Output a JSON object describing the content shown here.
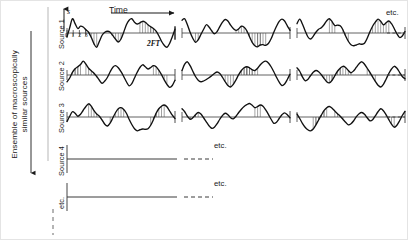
{
  "figure": {
    "title_axis_time": "Time",
    "amplitude_symbol": "s",
    "ensemble_label": "Ensemble of macroscopically\nsimilar sources",
    "tick_numbers": "0 1 2 3",
    "interval_label": "2FT",
    "etc_right_top": "etc.",
    "etc_row_source4": "etc.",
    "etc_row_etc": "etc.",
    "row_labels": [
      "Source 1",
      "Source 2",
      "Source 3",
      "Source 4",
      "etc."
    ],
    "colors": {
      "ink": "#1a1a1a",
      "trace": "#111111",
      "baseline": "#3a3a3a",
      "hatch": "#555555",
      "frame": "#e4e4e4",
      "background": "#ffffff"
    }
  },
  "chart_data": {
    "type": "line",
    "xlabel": "Time",
    "ylabel": "s",
    "grid": false,
    "legend": null,
    "x_tick_labels": [
      "0",
      "1",
      "2",
      "3"
    ],
    "annotations": [
      "2FT",
      "etc."
    ],
    "panel_columns": 3,
    "panel_rows": 3,
    "note": "Rows 4 and 5 (Source 4, etc.) are drawn as blank baselines continued by dashed lines ending in 'etc.'",
    "series": [
      {
        "name": "Source 1 / segment 1",
        "x": [
          0,
          1,
          2,
          3,
          4,
          5,
          6,
          7,
          8,
          9,
          10,
          11,
          12,
          13,
          14,
          15,
          16,
          17,
          18,
          19,
          20,
          21,
          22,
          23,
          24,
          25,
          26,
          27,
          28,
          29,
          30,
          31,
          32,
          33,
          34,
          35,
          36,
          37,
          38,
          39,
          40
        ],
        "values": [
          -0.25,
          0.35,
          0.95,
          0.62,
          0.3,
          0.46,
          0.4,
          0.22,
          0.05,
          -0.3,
          -0.72,
          -0.95,
          -0.55,
          -0.15,
          0.05,
          0.12,
          0.05,
          -0.18,
          -0.42,
          -0.6,
          -0.4,
          0.05,
          0.55,
          0.85,
          0.95,
          0.72,
          0.6,
          0.68,
          0.78,
          0.72,
          0.55,
          0.42,
          0.3,
          0.12,
          -0.18,
          -0.55,
          -0.82,
          -0.95,
          -0.7,
          -0.25,
          0.25
        ]
      },
      {
        "name": "Source 1 / segment 2",
        "x": [
          0,
          1,
          2,
          3,
          4,
          5,
          6,
          7,
          8,
          9,
          10,
          11,
          12,
          13,
          14,
          15,
          16,
          17,
          18,
          19,
          20,
          21,
          22,
          23,
          24,
          25,
          26,
          27,
          28,
          29,
          30,
          31,
          32,
          33,
          34,
          35,
          36,
          37,
          38,
          39,
          40
        ],
        "values": [
          0.85,
          0.95,
          0.55,
          0.05,
          -0.35,
          -0.62,
          -0.45,
          -0.1,
          0.25,
          0.55,
          0.4,
          0.15,
          -0.05,
          0.1,
          0.42,
          0.72,
          0.9,
          0.8,
          0.52,
          0.3,
          0.18,
          0.28,
          0.45,
          0.38,
          0.15,
          -0.25,
          -0.62,
          -0.85,
          -0.92,
          -0.8,
          -0.78,
          -0.82,
          -0.7,
          -0.38,
          0.05,
          0.45,
          0.78,
          0.92,
          0.8,
          0.48,
          0.18
        ]
      },
      {
        "name": "Source 1 / segment 3",
        "x": [
          0,
          1,
          2,
          3,
          4,
          5,
          6,
          7,
          8,
          9,
          10,
          11,
          12,
          13,
          14,
          15,
          16,
          17,
          18,
          19,
          20,
          21,
          22,
          23,
          24,
          25,
          26,
          27,
          28,
          29,
          30,
          31,
          32,
          33,
          34,
          35,
          36,
          37,
          38,
          39,
          40
        ],
        "values": [
          0.62,
          0.92,
          0.6,
          0.15,
          -0.25,
          -0.4,
          -0.22,
          0.05,
          0.25,
          0.35,
          0.55,
          0.82,
          0.95,
          0.75,
          0.5,
          0.52,
          0.48,
          0.22,
          -0.2,
          -0.55,
          -0.78,
          -0.85,
          -0.8,
          -0.72,
          -0.75,
          -0.68,
          -0.35,
          0.08,
          0.45,
          0.72,
          0.92,
          0.78,
          0.55,
          0.68,
          0.8,
          0.62,
          0.3,
          -0.05,
          -0.3,
          -0.2,
          0.1
        ]
      },
      {
        "name": "Source 2 / segment 1",
        "x": [
          0,
          1,
          2,
          3,
          4,
          5,
          6,
          7,
          8,
          9,
          10,
          11,
          12,
          13,
          14,
          15,
          16,
          17,
          18,
          19,
          20,
          21,
          22,
          23,
          24,
          25,
          26,
          27,
          28,
          29,
          30,
          31,
          32,
          33,
          34,
          35,
          36,
          37,
          38,
          39,
          40
        ],
        "values": [
          -0.45,
          -0.2,
          0.18,
          0.42,
          0.55,
          0.7,
          0.92,
          0.72,
          0.45,
          0.28,
          0.12,
          -0.1,
          -0.35,
          -0.55,
          -0.4,
          -0.15,
          0.22,
          0.52,
          0.62,
          0.48,
          0.22,
          -0.1,
          -0.45,
          -0.72,
          -0.58,
          -0.2,
          0.18,
          0.5,
          0.68,
          0.55,
          0.4,
          0.5,
          0.62,
          0.55,
          0.32,
          0.02,
          -0.32,
          -0.62,
          -0.82,
          -0.7,
          -0.35
        ]
      },
      {
        "name": "Source 2 / segment 2",
        "x": [
          0,
          1,
          2,
          3,
          4,
          5,
          6,
          7,
          8,
          9,
          10,
          11,
          12,
          13,
          14,
          15,
          16,
          17,
          18,
          19,
          20,
          21,
          22,
          23,
          24,
          25,
          26,
          27,
          28,
          29,
          30,
          31,
          32,
          33,
          34,
          35,
          36,
          37,
          38,
          39,
          40
        ],
        "values": [
          0.3,
          0.72,
          0.88,
          0.62,
          0.25,
          -0.1,
          -0.35,
          -0.45,
          -0.4,
          -0.3,
          -0.18,
          -0.05,
          0.1,
          0.2,
          0.1,
          -0.15,
          -0.45,
          -0.7,
          -0.8,
          -0.62,
          -0.32,
          0.02,
          0.3,
          0.48,
          0.55,
          0.48,
          0.35,
          0.3,
          0.45,
          0.68,
          0.85,
          0.92,
          0.8,
          0.55,
          0.22,
          -0.15,
          -0.48,
          -0.7,
          -0.6,
          -0.3,
          0.05
        ]
      },
      {
        "name": "Source 2 / segment 3",
        "x": [
          0,
          1,
          2,
          3,
          4,
          5,
          6,
          7,
          8,
          9,
          10,
          11,
          12,
          13,
          14,
          15,
          16,
          17,
          18,
          19,
          20,
          21,
          22,
          23,
          24,
          25,
          26,
          27,
          28,
          29,
          30,
          31,
          32,
          33,
          34,
          35,
          36,
          37,
          38,
          39,
          40
        ],
        "values": [
          0.48,
          0.25,
          -0.12,
          -0.38,
          -0.3,
          -0.05,
          0.18,
          0.3,
          0.22,
          0.02,
          -0.22,
          -0.45,
          -0.52,
          -0.35,
          -0.05,
          0.25,
          0.45,
          0.58,
          0.5,
          0.3,
          0.15,
          0.28,
          0.52,
          0.75,
          0.88,
          0.72,
          0.45,
          0.18,
          -0.12,
          -0.42,
          -0.68,
          -0.8,
          -0.62,
          -0.28,
          0.1,
          0.4,
          0.58,
          0.45,
          0.18,
          -0.1,
          -0.25
        ]
      },
      {
        "name": "Source 3 / segment 1",
        "x": [
          0,
          1,
          2,
          3,
          4,
          5,
          6,
          7,
          8,
          9,
          10,
          11,
          12,
          13,
          14,
          15,
          16,
          17,
          18,
          19,
          20,
          21,
          22,
          23,
          24,
          25,
          26,
          27,
          28,
          29,
          30,
          31,
          32,
          33,
          34,
          35,
          36,
          37,
          38,
          39,
          40
        ],
        "values": [
          -0.3,
          0.05,
          0.35,
          0.25,
          0.05,
          0.18,
          0.45,
          0.7,
          0.88,
          0.72,
          0.42,
          0.2,
          0.05,
          -0.2,
          -0.48,
          -0.6,
          -0.4,
          -0.05,
          0.3,
          0.55,
          0.62,
          0.5,
          0.25,
          -0.15,
          -0.5,
          -0.78,
          -0.92,
          -0.85,
          -0.8,
          -0.82,
          -0.78,
          -0.55,
          -0.18,
          0.25,
          0.55,
          0.72,
          0.8,
          0.68,
          0.4,
          0.12,
          -0.1
        ]
      },
      {
        "name": "Source 3 / segment 2",
        "x": [
          0,
          1,
          2,
          3,
          4,
          5,
          6,
          7,
          8,
          9,
          10,
          11,
          12,
          13,
          14,
          15,
          16,
          17,
          18,
          19,
          20,
          21,
          22,
          23,
          24,
          25,
          26,
          27,
          28,
          29,
          30,
          31,
          32,
          33,
          34,
          35,
          36,
          37,
          38,
          39,
          40
        ],
        "values": [
          0.55,
          0.35,
          0.05,
          -0.15,
          -0.05,
          0.15,
          0.3,
          0.2,
          -0.05,
          -0.32,
          -0.58,
          -0.75,
          -0.68,
          -0.45,
          -0.15,
          0.1,
          0.25,
          0.15,
          -0.05,
          -0.12,
          0.05,
          0.3,
          0.52,
          0.7,
          0.82,
          0.9,
          0.78,
          0.62,
          0.7,
          0.8,
          0.72,
          0.48,
          0.18,
          -0.15,
          -0.42,
          -0.35,
          -0.1,
          0.15,
          0.28,
          0.15,
          -0.05
        ]
      },
      {
        "name": "Source 3 / segment 3",
        "x": [
          0,
          1,
          2,
          3,
          4,
          5,
          6,
          7,
          8,
          9,
          10,
          11,
          12,
          13,
          14,
          15,
          16,
          17,
          18,
          19,
          20,
          21,
          22,
          23,
          24,
          25,
          26,
          27,
          28,
          29,
          30,
          31,
          32,
          33,
          34,
          35,
          36,
          37,
          38,
          39,
          40
        ],
        "values": [
          0.2,
          -0.1,
          -0.42,
          -0.68,
          -0.85,
          -0.92,
          -0.8,
          -0.52,
          -0.2,
          0.12,
          0.42,
          0.62,
          0.7,
          0.58,
          0.4,
          0.22,
          0.05,
          -0.15,
          -0.35,
          -0.52,
          -0.45,
          -0.25,
          0.02,
          0.22,
          0.3,
          0.18,
          -0.05,
          -0.25,
          -0.18,
          0.08,
          0.35,
          0.55,
          0.42,
          0.15,
          -0.18,
          -0.48,
          -0.68,
          -0.55,
          -0.25,
          0.1,
          0.38
        ]
      }
    ]
  }
}
